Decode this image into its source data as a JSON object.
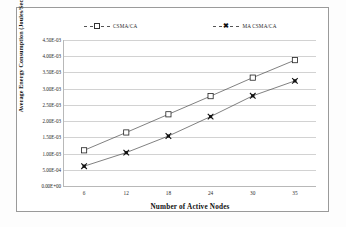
{
  "chart_data": {
    "type": "line",
    "title": "",
    "xlabel": "Number of Active Nodes",
    "ylabel": "Average Energy Consumption (Joules/Sec)",
    "categories": [
      "6",
      "12",
      "18",
      "24",
      "30",
      "35"
    ],
    "x": [
      6,
      12,
      18,
      24,
      30,
      35
    ],
    "ylim": [
      0,
      0.0045
    ],
    "ytick_labels": [
      "4.50E-03",
      "4.00E-03",
      "3.50E-03",
      "3.00E-03",
      "2.50E-03",
      "2.00E-03",
      "1.50E-03",
      "1.00E-03",
      "5.00E-04",
      "0.00E+00"
    ],
    "ytick_values": [
      0.0045,
      0.004,
      0.0035,
      0.003,
      0.0025,
      0.002,
      0.0015,
      0.001,
      0.0005,
      0.0
    ],
    "grid": "horizontal",
    "legend_position": "top",
    "series": [
      {
        "name": "CSMA/CA",
        "marker": "open-square",
        "values": [
          0.0011,
          0.00165,
          0.00221,
          0.00277,
          0.00334,
          0.00388
        ]
      },
      {
        "name": "MA CSMA/CA",
        "marker": "filled-x",
        "values": [
          0.00061,
          0.00103,
          0.00154,
          0.00214,
          0.00278,
          0.00324
        ]
      }
    ]
  },
  "legend": {
    "items": [
      {
        "label": "CSMA/CA"
      },
      {
        "label": "MA CSMA/CA"
      }
    ]
  },
  "axes": {
    "x_title": "Number of Active Nodes",
    "y_title": "Average Energy Consumption (Joules/Sec)"
  }
}
